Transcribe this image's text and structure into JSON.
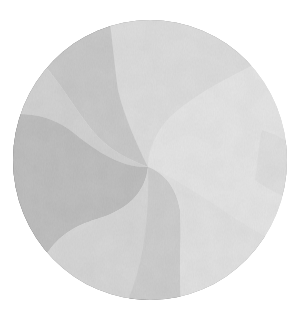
{
  "image": {
    "description": "Circular grayscale fabric swirl with curved pinwheel wedges radiating from an off-center point",
    "background": "#ffffff",
    "circle": {
      "cx": 150,
      "cy": 160,
      "rx": 137,
      "ry": 140
    },
    "swirl_center": {
      "x": 148,
      "y": 167
    },
    "wedges": [
      {
        "name": "black-wedge",
        "color": "#2a2a2a"
      },
      {
        "name": "medium-gray-band",
        "color": "#6a6a6a"
      },
      {
        "name": "dark-gray-wedge",
        "color": "#4e4e4e"
      },
      {
        "name": "mottled-gray-wedge",
        "color": "#8e8e8e"
      },
      {
        "name": "light-gray-wedge",
        "color": "#a9a9a9"
      },
      {
        "name": "lower-light-band",
        "color": "#9c9c9c"
      },
      {
        "name": "textured-dark-wedge",
        "color": "#5c5c5c"
      },
      {
        "name": "lower-left-gray-wedge",
        "color": "#7a7a7a"
      }
    ]
  }
}
